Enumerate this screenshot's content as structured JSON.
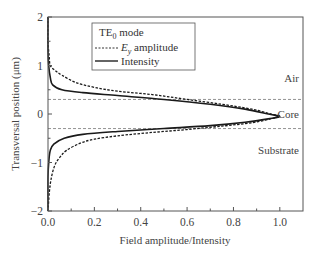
{
  "chart_data": {
    "type": "line",
    "title": "",
    "xlabel": "Field amplitude/Intensity",
    "ylabel": "Transversal position (μm)",
    "xlim": [
      0.0,
      1.1
    ],
    "ylim": [
      -2,
      2
    ],
    "xticks": [
      "0.0",
      "0.2",
      "0.4",
      "0.6",
      "0.8",
      "1.0"
    ],
    "xtick_values": [
      0.0,
      0.2,
      0.4,
      0.6,
      0.8,
      1.0
    ],
    "yticks": [
      "2",
      "1",
      "0",
      "−1",
      "−2"
    ],
    "ytick_values": [
      2,
      1,
      0,
      -1,
      -2
    ],
    "grid": false,
    "legend": {
      "position": "upper center",
      "title": "TE0 mode",
      "title_main": "TE",
      "title_sub": "0",
      "title_rest": " mode",
      "entries": [
        {
          "label": "E_y amplitude",
          "label_main": "E",
          "label_sub": "y",
          "label_rest": " amplitude",
          "style": "dashed"
        },
        {
          "label": "Intensity",
          "style": "solid"
        }
      ]
    },
    "region_boundaries": [
      0.3,
      -0.3
    ],
    "region_labels": [
      {
        "text": "Air",
        "x": 1.07,
        "y": 0.75
      },
      {
        "text": "Core",
        "x": 1.07,
        "y": 0.0
      },
      {
        "text": "Substrate",
        "x": 1.07,
        "y": -0.75
      }
    ],
    "series": [
      {
        "name": "E_y amplitude",
        "style": "dashed",
        "points": [
          [
            0.0,
            2.0
          ],
          [
            0.0,
            1.5
          ],
          [
            0.005,
            1.2
          ],
          [
            0.01,
            1.0
          ],
          [
            0.03,
            0.9
          ],
          [
            0.06,
            0.8
          ],
          [
            0.12,
            0.65
          ],
          [
            0.2,
            0.55
          ],
          [
            0.3,
            0.47
          ],
          [
            0.45,
            0.4
          ],
          [
            0.6,
            0.3
          ],
          [
            0.75,
            0.2
          ],
          [
            0.88,
            0.1
          ],
          [
            0.96,
            0.0
          ],
          [
            1.0,
            -0.05
          ],
          [
            0.96,
            -0.1
          ],
          [
            0.88,
            -0.18
          ],
          [
            0.75,
            -0.25
          ],
          [
            0.6,
            -0.32
          ],
          [
            0.45,
            -0.38
          ],
          [
            0.3,
            -0.45
          ],
          [
            0.2,
            -0.52
          ],
          [
            0.14,
            -0.6
          ],
          [
            0.08,
            -0.75
          ],
          [
            0.05,
            -0.9
          ],
          [
            0.03,
            -1.05
          ],
          [
            0.015,
            -1.3
          ],
          [
            0.006,
            -1.6
          ],
          [
            0.0,
            -2.0
          ]
        ]
      },
      {
        "name": "Intensity",
        "style": "solid",
        "points": [
          [
            0.0,
            2.0
          ],
          [
            0.0,
            1.3
          ],
          [
            0.003,
            1.0
          ],
          [
            0.01,
            0.75
          ],
          [
            0.02,
            0.6
          ],
          [
            0.06,
            0.5
          ],
          [
            0.15,
            0.44
          ],
          [
            0.3,
            0.38
          ],
          [
            0.5,
            0.3
          ],
          [
            0.7,
            0.2
          ],
          [
            0.85,
            0.1
          ],
          [
            0.95,
            0.0
          ],
          [
            1.0,
            -0.05
          ],
          [
            0.95,
            -0.1
          ],
          [
            0.85,
            -0.17
          ],
          [
            0.7,
            -0.24
          ],
          [
            0.5,
            -0.3
          ],
          [
            0.3,
            -0.36
          ],
          [
            0.15,
            -0.42
          ],
          [
            0.07,
            -0.5
          ],
          [
            0.025,
            -0.62
          ],
          [
            0.01,
            -0.75
          ],
          [
            0.004,
            -0.95
          ],
          [
            0.0,
            -1.3
          ],
          [
            0.0,
            -2.0
          ]
        ]
      }
    ]
  }
}
